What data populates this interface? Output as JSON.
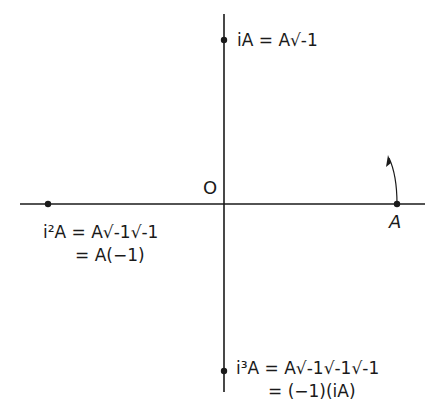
{
  "diagram": {
    "type": "complex-plane rotation by i",
    "origin_label": "O",
    "point_A_label": "A",
    "labels": {
      "iA": {
        "lhs": "iA",
        "rhs": "A√-1"
      },
      "i2A": {
        "lhs": "i²A",
        "rhs": "A√-1√-1",
        "line2": "= A(−1)"
      },
      "i3A": {
        "lhs": "i³A",
        "rhs": "A√-1√-1√-1",
        "line2": "= (−1)(iA)"
      }
    },
    "rotation_arrow": "counterclockwise arc arrow near A",
    "colors": {
      "stroke": "#1a1a1a",
      "background": "#ffffff"
    }
  },
  "text": {
    "origin": "O",
    "A": "A",
    "iA_line": "iA = A√-1",
    "i2A_line1": "i²A = A√-1√-1",
    "i2A_line2": "= A(−1)",
    "i3A_line1": "i³A = A√-1√-1√-1",
    "i3A_line2": "= (−1)(iA)"
  }
}
